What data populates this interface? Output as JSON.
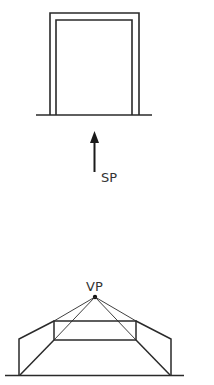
{
  "labels": {
    "station_point": "SP",
    "vanishing_point": "VP"
  },
  "colors": {
    "line": "#2a2a2a",
    "background": "#ffffff"
  },
  "figures": {
    "top": "Elevation of a doorway frame standing on a ground line, viewed from station point SP (arrow)",
    "bottom": "One-point perspective of a corridor/room converging to vanishing point VP"
  }
}
